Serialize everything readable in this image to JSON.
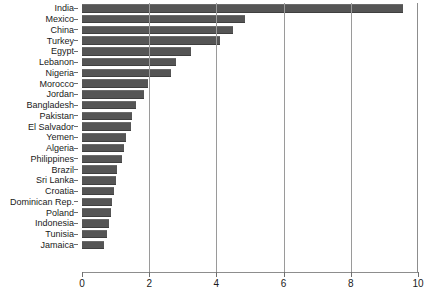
{
  "chart_data": {
    "type": "bar",
    "orientation": "horizontal",
    "title": "",
    "subtitle": "",
    "xlabel": "",
    "ylabel": "",
    "xlim": [
      0,
      10
    ],
    "ylim": null,
    "grid": true,
    "legend": null,
    "legend_position": "none",
    "xticks": [
      "0",
      "2",
      "4",
      "6",
      "8",
      "10"
    ],
    "xtick_values": [
      0,
      2,
      4,
      6,
      8,
      10
    ],
    "bar_color": "#555555",
    "categories": [
      "India",
      "Mexico",
      "China",
      "Turkey",
      "Egypt",
      "Lebanon",
      "Nigeria",
      "Morocco",
      "Jordan",
      "Bangladesh",
      "Pakistan",
      "El Salvador",
      "Yemen",
      "Algeria",
      "Philippines",
      "Brazil",
      "Sri Lanka",
      "Croatia",
      "Dominican Rep.",
      "Poland",
      "Indonesia",
      "Tunisia",
      "Jamaica"
    ],
    "values": [
      9.55,
      4.85,
      4.5,
      4.1,
      3.25,
      2.8,
      2.65,
      1.95,
      1.85,
      1.6,
      1.5,
      1.45,
      1.3,
      1.25,
      1.2,
      1.05,
      1.0,
      0.95,
      0.9,
      0.85,
      0.8,
      0.75,
      0.65
    ]
  }
}
